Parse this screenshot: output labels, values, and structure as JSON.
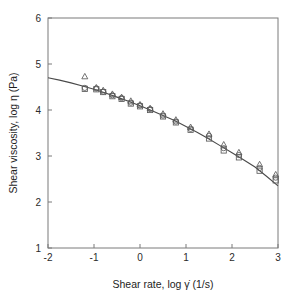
{
  "chart_data": {
    "type": "scatter",
    "title": "",
    "xlabel": "Shear rate, log γ̇ (1/s)",
    "ylabel": "Shear viscosity, log η (Pa)",
    "xlim": [
      -2,
      3
    ],
    "ylim": [
      1,
      6
    ],
    "xticks": [
      -2,
      -1,
      0,
      1,
      2,
      3
    ],
    "xtick_labels": [
      "-2",
      "-1",
      "0",
      "1",
      "2",
      "3"
    ],
    "yticks": [
      1,
      2,
      3,
      4,
      5,
      6
    ],
    "ytick_labels": [
      "1",
      "2",
      "3",
      "4",
      "5",
      "6"
    ],
    "grid": false,
    "legend": "none",
    "series": [
      {
        "name": "triangle-series",
        "marker": "triangle",
        "x": [
          -1.2,
          -0.95,
          -0.8,
          -0.6,
          -0.4,
          -0.2,
          0.0,
          0.22,
          0.5,
          0.78,
          1.1,
          1.5,
          1.82,
          2.15,
          2.6,
          2.95
        ],
        "y": [
          4.73,
          4.49,
          4.43,
          4.35,
          4.28,
          4.2,
          4.12,
          4.04,
          3.92,
          3.79,
          3.63,
          3.48,
          3.25,
          3.08,
          2.82,
          2.6
        ]
      },
      {
        "name": "circle-series",
        "marker": "circle",
        "x": [
          -1.2,
          -0.95,
          -0.8,
          -0.6,
          -0.4,
          -0.2,
          0.0,
          0.22,
          0.5,
          0.78,
          1.1,
          1.5,
          1.82,
          2.15,
          2.6,
          2.95
        ],
        "y": [
          4.48,
          4.47,
          4.4,
          4.32,
          4.26,
          4.16,
          4.1,
          4.02,
          3.88,
          3.75,
          3.59,
          3.44,
          3.17,
          3.02,
          2.74,
          2.53
        ]
      },
      {
        "name": "square-series",
        "marker": "square",
        "x": [
          -1.2,
          -0.95,
          -0.8,
          -0.6,
          -0.4,
          -0.2,
          0.0,
          0.22,
          0.5,
          0.78,
          1.1,
          1.5,
          1.82,
          2.15,
          2.6,
          2.95
        ],
        "y": [
          4.46,
          4.45,
          4.39,
          4.3,
          4.24,
          4.14,
          4.08,
          4.0,
          3.86,
          3.73,
          3.57,
          3.38,
          3.12,
          2.97,
          2.68,
          2.47
        ]
      }
    ],
    "fit_curve": {
      "name": "carreau-fit",
      "x": [
        -2.0,
        -1.75,
        -1.5,
        -1.25,
        -1.0,
        -0.75,
        -0.5,
        -0.25,
        0.0,
        0.25,
        0.5,
        0.75,
        1.0,
        1.25,
        1.5,
        1.75,
        2.0,
        2.25,
        2.5,
        2.75,
        3.0
      ],
      "y": [
        4.7,
        4.65,
        4.59,
        4.52,
        4.45,
        4.37,
        4.28,
        4.19,
        4.09,
        3.99,
        3.88,
        3.77,
        3.64,
        3.51,
        3.37,
        3.22,
        3.07,
        2.92,
        2.76,
        2.56,
        2.35
      ]
    }
  }
}
